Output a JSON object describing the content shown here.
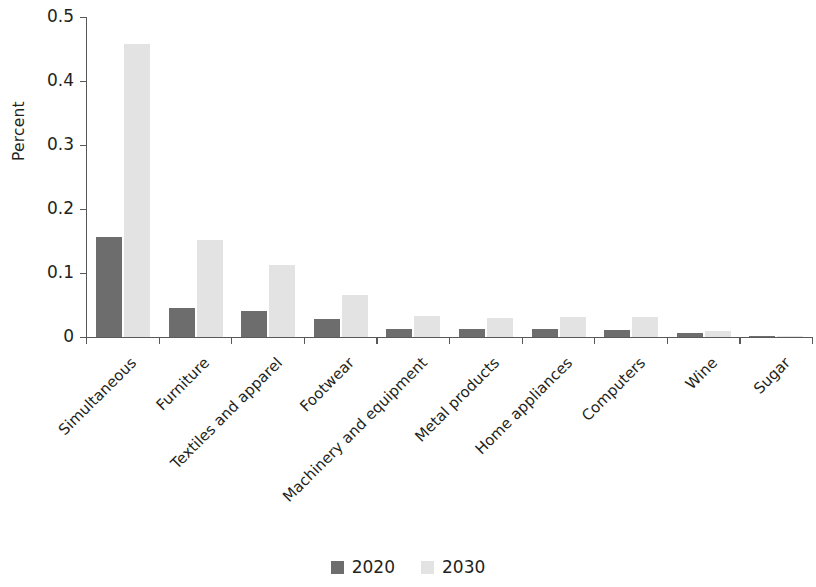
{
  "chart_data": {
    "type": "bar",
    "title": "",
    "subtitle": "",
    "xlabel": "",
    "ylabel": "Percent",
    "ylim": [
      0,
      0.5
    ],
    "yticks": [
      0,
      0.1,
      0.2,
      0.3,
      0.4,
      0.5
    ],
    "ytick_labels": [
      "0",
      "0.1",
      "0.2",
      "0.3",
      "0.4",
      "0.5"
    ],
    "grid": false,
    "legend_position": "bottom-center",
    "categories": [
      "Simultaneous",
      "Furniture",
      "Textiles and apparel",
      "Footwear",
      "Machinery and equipment",
      "Metal products",
      "Home appliances",
      "Computers",
      "Wine",
      "Sugar"
    ],
    "series": [
      {
        "name": "2020",
        "color": "#6d6d6d",
        "values": [
          0.156,
          0.046,
          0.041,
          0.028,
          0.013,
          0.012,
          0.012,
          0.011,
          0.006,
          0.001
        ]
      },
      {
        "name": "2030",
        "color": "#e3e3e3",
        "values": [
          0.458,
          0.152,
          0.112,
          0.066,
          0.033,
          0.03,
          0.032,
          0.032,
          0.009,
          0.002
        ]
      }
    ]
  },
  "legend": {
    "entries": [
      {
        "label": "2020",
        "color": "#6d6d6d"
      },
      {
        "label": "2030",
        "color": "#e3e3e3"
      }
    ]
  },
  "axes": {
    "y_title": "Percent"
  }
}
